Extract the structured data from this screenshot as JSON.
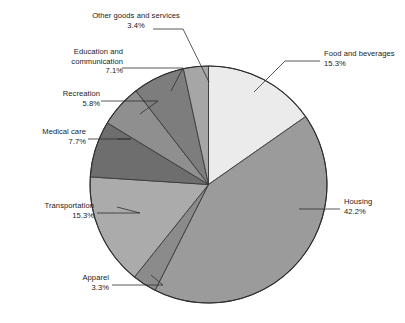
{
  "chart_data": {
    "type": "pie",
    "title": "",
    "subtitle": "",
    "xlabel": "",
    "ylabel": "",
    "legend_position": "callout-labels",
    "grid": false,
    "start_angle_deg": 0,
    "direction": "clockwise",
    "value_unit": "percent",
    "categories": [
      "Food and beverages",
      "Housing",
      "Apparel",
      "Transportation",
      "Medical care",
      "Recreation",
      "Education and communication",
      "Other goods and services"
    ],
    "values": [
      15.3,
      42.2,
      3.3,
      15.3,
      7.7,
      5.8,
      7.1,
      3.4
    ],
    "value_labels": [
      "15.3%",
      "42.2%",
      "3.3%",
      "15.3%",
      "7.7%",
      "5.8%",
      "7.1%",
      "3.4%"
    ],
    "colors": [
      "#ebebeb",
      "#9b9b9b",
      "#8b8b8b",
      "#ababab",
      "#6e6e6e",
      "#8f8f8f",
      "#7d7d7d",
      "#a6a6a6"
    ],
    "slice_border_color": "#3a3a3a",
    "outline_color": "#2e2e2e"
  },
  "labels": [
    {
      "id": "other-goods-and-services",
      "name": "Other goods and services",
      "pct": "3.4%",
      "lines": [
        "Other goods and services",
        "3.4%"
      ]
    },
    {
      "id": "education-and-communication",
      "name": "Education and communication",
      "pct": "7.1%",
      "lines": [
        "Education and",
        "communication",
        "7.1%"
      ]
    },
    {
      "id": "recreation",
      "name": "Recreation",
      "pct": "5.8%",
      "lines": [
        "Recreation",
        "5.8%"
      ]
    },
    {
      "id": "medical-care",
      "name": "Medical care",
      "pct": "7.7%",
      "lines": [
        "Medical care",
        "7.7%"
      ]
    },
    {
      "id": "transportation",
      "name": "Transportation",
      "pct": "15.3%",
      "lines": [
        "Transportation",
        "15.3%"
      ]
    },
    {
      "id": "apparel",
      "name": "Apparel",
      "pct": "3.3%",
      "lines": [
        "Apparel",
        "3.3%"
      ]
    },
    {
      "id": "food-and-beverages",
      "name": "Food and beverages",
      "pct": "15.3%",
      "lines": [
        "Food and beverages",
        "15.3%"
      ]
    },
    {
      "id": "housing",
      "name": "Housing",
      "pct": "42.2%",
      "lines": [
        "Housing",
        "42.2%"
      ]
    }
  ],
  "label_text": {
    "other_goods_name": "Other goods and services",
    "other_goods_pct": "3.4%",
    "education_line1": "Education and",
    "education_line2": "communication",
    "education_pct": "7.1%",
    "recreation_name": "Recreation",
    "recreation_pct": "5.8%",
    "medical_name": "Medical care",
    "medical_pct": "7.7%",
    "transportation_name": "Transportation",
    "transportation_pct": "15.3%",
    "apparel_name": "Apparel",
    "apparel_pct": "3.3%",
    "food_name": "Food and beverages",
    "food_pct": "15.3%",
    "housing_name": "Housing",
    "housing_pct": "42.2%"
  }
}
